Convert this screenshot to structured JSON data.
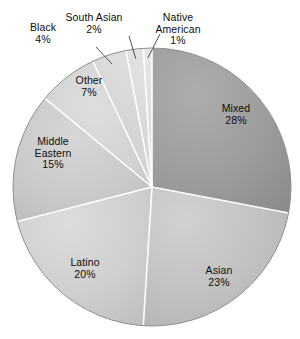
{
  "chart_data": {
    "type": "pie",
    "title": "",
    "subtitle": "",
    "xlabel": "",
    "ylabel": "",
    "legend_position": "none",
    "grid": false,
    "units": "percent",
    "total": 100,
    "categories": [
      "Mixed",
      "Asian",
      "Latino",
      "Middle Eastern",
      "Other",
      "Black",
      "South Asian",
      "Native American"
    ],
    "values": [
      28,
      23,
      20,
      15,
      7,
      4,
      2,
      1
    ],
    "start_angle_deg": 0,
    "direction": "clockwise",
    "slices": [
      {
        "label": "Mixed",
        "value": 28,
        "value_text": "28%",
        "color": "#9c9c9c",
        "label_placement": "inside",
        "label_x": 236,
        "label_y": 103,
        "leader_line": false
      },
      {
        "label": "Asian",
        "value": 23,
        "value_text": "23%",
        "color": "#c2c2c2",
        "label_placement": "inside",
        "label_x": 219,
        "label_y": 265,
        "leader_line": false
      },
      {
        "label": "Latino",
        "value": 20,
        "value_text": "20%",
        "color": "#cfcfcf",
        "label_placement": "inside",
        "label_x": 85,
        "label_y": 257,
        "leader_line": false
      },
      {
        "label": "Middle Eastern",
        "value": 15,
        "value_text": "15%",
        "color": "#c9c9c9",
        "label_placement": "inside",
        "label_x": 53,
        "label_y": 136,
        "label_lines": [
          "Middle",
          "Eastern"
        ]
      },
      {
        "label": "Other",
        "value": 7,
        "value_text": "7%",
        "color": "#d2d2d2",
        "label_placement": "inside",
        "label_x": 89,
        "label_y": 75,
        "leader_line": false
      },
      {
        "label": "Black",
        "value": 4,
        "value_text": "4%",
        "color": "#d6d6d6",
        "label_placement": "outside",
        "label_x": 43,
        "label_y": 22,
        "leader_line": true
      },
      {
        "label": "South Asian",
        "value": 2,
        "value_text": "2%",
        "color": "#dadada",
        "label_placement": "outside",
        "label_x": 94,
        "label_y": 12,
        "leader_line": true
      },
      {
        "label": "Native American",
        "value": 1,
        "value_text": "1%",
        "color": "#dedede",
        "label_placement": "outside",
        "label_x": 178,
        "label_y": 12,
        "label_lines": [
          "Native",
          "American"
        ],
        "leader_line": true
      }
    ],
    "geometry": {
      "center_x": 152,
      "center_y": 187,
      "radius": 139
    },
    "style": {
      "background": "#ffffff",
      "divider_color": "#ffffff",
      "outline_color": "#8a8a8a",
      "leader_line_color": "#3d3d3d",
      "text_color": "#0d0d0d"
    }
  }
}
